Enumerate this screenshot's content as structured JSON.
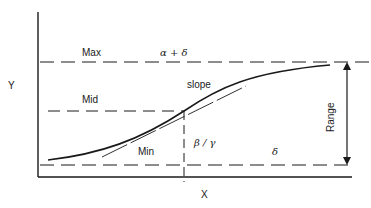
{
  "diagram": {
    "type": "sigmoid-curve-parameters",
    "axes": {
      "x_label": "X",
      "y_label": "Y"
    },
    "levels": {
      "max_label": "Max",
      "max_expr": "α + δ",
      "mid_label": "Mid",
      "min_label": "Min",
      "min_expr": "δ"
    },
    "annotations": {
      "slope_label": "slope",
      "inflection_expr": "β / γ",
      "range_label": "Range"
    },
    "colors": {
      "ink": "#1a1a1a",
      "background": "#ffffff"
    }
  }
}
